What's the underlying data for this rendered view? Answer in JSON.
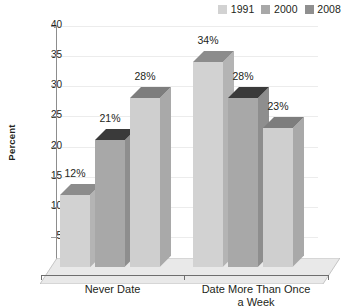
{
  "chart_data": {
    "type": "bar",
    "title": "",
    "subtitle": "",
    "xlabel": "",
    "ylabel": "Percent",
    "categories": [
      "Never Date",
      "Date More Than Once a Week"
    ],
    "category_lines": [
      [
        "Never Date"
      ],
      [
        "Date More Than Once",
        "a Week"
      ]
    ],
    "series": [
      {
        "name": "1991",
        "values": [
          12,
          34
        ],
        "labels": [
          "12%",
          "34%"
        ],
        "color": "#d2d2d2",
        "top_color": "#8c8c8c",
        "side_color": "#b4b4b4"
      },
      {
        "name": "2000",
        "values": [
          21,
          28
        ],
        "labels": [
          "21%",
          "28%"
        ],
        "color": "#a8a8a8",
        "top_color": "#3a3a3a",
        "side_color": "#8e8e8e"
      },
      {
        "name": "2008",
        "values": [
          28,
          23
        ],
        "labels": [
          "28%",
          "23%"
        ],
        "color": "#cfcfcf",
        "top_color": "#7d7d7d",
        "side_color": "#a9a9a9"
      }
    ],
    "ylim": [
      0,
      40
    ],
    "yticks": [
      0,
      5,
      10,
      15,
      20,
      25,
      30,
      35,
      40
    ],
    "ytick_labels": [
      "0",
      "5",
      "10",
      "15",
      "20",
      "25",
      "30",
      "35",
      "40"
    ],
    "grid": true,
    "grid_axis": "y",
    "legend_position": "top-right",
    "projection": "3d",
    "value_labels": true,
    "background": "#ffffff"
  },
  "legend": {
    "entries": [
      {
        "label": "1991",
        "swatch": "#d2d2d2"
      },
      {
        "label": "2000",
        "swatch": "#a8a8a8"
      },
      {
        "label": "2008",
        "swatch": "#8f8f8f"
      }
    ]
  },
  "axis": {
    "y_title": "Percent"
  }
}
